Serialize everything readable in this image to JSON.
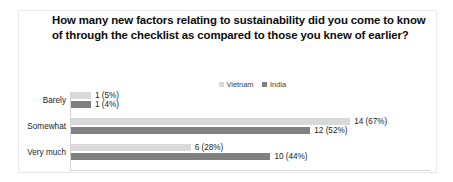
{
  "chart_data": {
    "type": "bar",
    "orientation": "horizontal",
    "title": "How many new factors relating to sustainability did you come to know of through the checklist as compared to those you knew of earlier?",
    "xlabel": "",
    "ylabel": "",
    "grid": false,
    "legend_position": "top-center",
    "categories": [
      "Barely",
      "Somewhat",
      "Very much"
    ],
    "xlim": [
      0,
      16
    ],
    "series": [
      {
        "name": "Vietnam",
        "color": "#D9D9D9",
        "values": [
          1,
          14,
          6
        ],
        "percents": [
          5,
          67,
          28
        ],
        "labels": [
          "1 (5%)",
          "14 (67%)",
          "6 (28%)"
        ]
      },
      {
        "name": "India",
        "color": "#808080",
        "values": [
          1,
          12,
          10
        ],
        "percents": [
          4,
          52,
          44
        ],
        "labels": [
          "1 (4%)",
          "12 (52%)",
          "10 (44%)"
        ]
      }
    ]
  },
  "legend": {
    "items": [
      {
        "label": "Vietnam",
        "color": "#D9D9D9"
      },
      {
        "label": "India",
        "color": "#808080"
      }
    ]
  },
  "colors": {
    "vietnam": "#D9D9D9",
    "india": "#808080",
    "axis": "#D6D6D6",
    "text": "#232323",
    "background": "#FFFFFF"
  }
}
